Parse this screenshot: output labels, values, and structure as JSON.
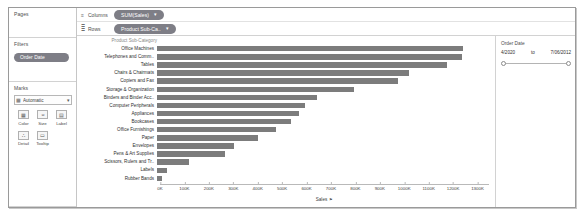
{
  "sidebar": {
    "pages": {
      "title": "Pages"
    },
    "filters": {
      "title": "Filters",
      "pills": [
        {
          "label": "Order Date"
        }
      ]
    },
    "marks": {
      "title": "Marks",
      "mark_type_icon": "bar-mark-icon",
      "mark_type": "Automatic",
      "caret": "▾",
      "buttons": [
        {
          "label": "Color",
          "icon": "color-icon",
          "glyph": "▦"
        },
        {
          "label": "Size",
          "icon": "size-icon",
          "glyph": "⦵"
        },
        {
          "label": "Label",
          "icon": "label-icon",
          "glyph": "▤"
        },
        {
          "label": "Detail",
          "icon": "detail-icon",
          "glyph": "∴"
        },
        {
          "label": "Tooltip",
          "icon": "tooltip-icon",
          "glyph": "▭"
        }
      ]
    }
  },
  "shelves": [
    {
      "name": "Columns",
      "icon": "columns-icon",
      "glyph": "≡",
      "pill": "SUM(Sales)",
      "caret": "▾"
    },
    {
      "name": "Rows",
      "icon": "rows-icon",
      "glyph": "≣",
      "pill": "Product Sub-Ca..",
      "caret": "▾"
    }
  ],
  "filter_card": {
    "title": "Order Date",
    "range_start": "4/2020",
    "range_to": "to",
    "range_end": "7/06/2012"
  },
  "chart_data": {
    "type": "bar",
    "title": "",
    "orientation": "horizontal",
    "row_field_label": "Product Sub-Category",
    "xlabel": "Sales",
    "ylabel": "Product Sub-Category",
    "xlim": [
      0,
      1300000
    ],
    "grid": false,
    "sort": "descending",
    "sort_icon": "⚑",
    "tick_labels": [
      "0K",
      "100K",
      "200K",
      "300K",
      "400K",
      "500K",
      "600K",
      "700K",
      "800K",
      "900K",
      "1000K",
      "1100K",
      "1200K",
      "1300K"
    ],
    "tick_values": [
      0,
      100000,
      200000,
      300000,
      400000,
      500000,
      600000,
      700000,
      800000,
      900000,
      1000000,
      1100000,
      1200000,
      1300000
    ],
    "categories": [
      "Office Machines",
      "Telephones and Comm..",
      "Tables",
      "Chairs & Chairmats",
      "Copiers and Fax",
      "Storage & Organization",
      "Binders and Binder Acc..",
      "Computer Peripherals",
      "Appliances",
      "Bookcases",
      "Office Furnishings",
      "Paper",
      "Envelopes",
      "Pens & Art Supplies",
      "Scissors, Rulers and Tr..",
      "Labels",
      "Rubber Bands"
    ],
    "values": [
      1218657,
      1214525,
      1156634,
      1004303,
      962455,
      784617,
      638585,
      589815,
      565166,
      535213,
      472928,
      404135,
      307235,
      269967,
      126962,
      41320,
      19450
    ]
  }
}
